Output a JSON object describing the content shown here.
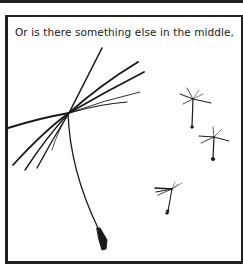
{
  "comic_panel": {
    "caption": "Or is there something else in the middle,",
    "illustration": {
      "subject": "dandelion seeds",
      "large_seed_count": 1,
      "small_seed_count": 3
    },
    "colors": {
      "ink": "#1a1a1a",
      "background": "#ffffff"
    }
  }
}
